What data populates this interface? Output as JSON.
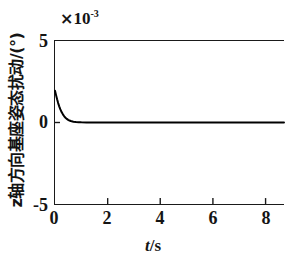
{
  "chart_data": {
    "type": "line",
    "title": "",
    "subtitle": "",
    "xlabel": "t/s",
    "xlabel_var": "t",
    "xlabel_unit": "/s",
    "ylabel": "z轴方向基座姿态扰动/(°)",
    "y_multiplier": "× 10",
    "y_multiplier_exponent": "-3",
    "y_multiplier_full": "× 10⁻³",
    "xlim": [
      0,
      8.7
    ],
    "ylim": [
      -0.005,
      0.005
    ],
    "ylim_scaled": [
      -5,
      5
    ],
    "xticks": [
      0,
      2,
      4,
      6,
      8
    ],
    "xticklabels": [
      "0",
      "2",
      "4",
      "6",
      "8"
    ],
    "yticks": [
      -0.005,
      0,
      0.005
    ],
    "yticklabels": [
      "-5",
      "0",
      "5"
    ],
    "grid": false,
    "legend": null,
    "series": [
      {
        "name": "z-axis base attitude disturbance",
        "color": "#000000",
        "linewidth": 2.0,
        "x": [
          0.0,
          0.04,
          0.08,
          0.12,
          0.16,
          0.2,
          0.25,
          0.3,
          0.35,
          0.4,
          0.45,
          0.5,
          0.55,
          0.6,
          0.7,
          0.8,
          0.9,
          1.0,
          1.2,
          1.4,
          1.6,
          1.8,
          2.0,
          2.5,
          3.0,
          3.5,
          4.0,
          4.5,
          5.0,
          5.5,
          6.0,
          6.5,
          7.0,
          7.5,
          8.0,
          8.5,
          8.7
        ],
        "y": [
          0.00195,
          0.00168,
          0.00142,
          0.00119,
          0.00099,
          0.00082,
          0.00064,
          0.0005,
          0.00038,
          0.00029,
          0.00022,
          0.00016,
          0.00012,
          9e-05,
          5e-05,
          3e-05,
          2e-05,
          1e-05,
          4e-06,
          2e-06,
          1e-06,
          5e-07,
          2e-07,
          0.0,
          0.0,
          0.0,
          0.0,
          0.0,
          0.0,
          0.0,
          0.0,
          0.0,
          0.0,
          0.0,
          0.0,
          0.0,
          0.0
        ]
      }
    ],
    "annotations": [
      {
        "text": "peak at t=0",
        "value": 0.00195,
        "value_scaled": 1.95
      },
      {
        "text": "settles to zero by t≈1 s",
        "value": 0.0,
        "value_scaled": 0.0
      }
    ]
  },
  "axis": {
    "y_multiplier_times": "×",
    "y_multiplier_base": "10",
    "y_multiplier_exp": "-3",
    "ylabel_text": "z轴方向基座姿态扰动/(°)",
    "xlabel_var": "t",
    "xlabel_rest": "/s"
  }
}
